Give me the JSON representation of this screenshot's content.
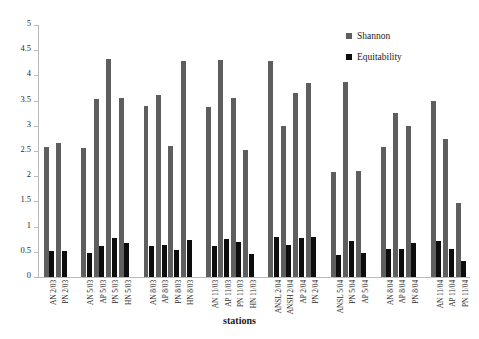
{
  "chart_data": {
    "type": "bar",
    "title": "",
    "xlabel": "stations",
    "ylabel": "",
    "ylim": [
      0,
      5
    ],
    "ytick_step": 0.5,
    "ytick_labels": [
      "0",
      "0.5",
      "1",
      "1.5",
      "2",
      "2.5",
      "3",
      "3.5",
      "4",
      "4.5",
      "5"
    ],
    "grid": false,
    "legend_position": "top-right",
    "categories": [
      "AN 2/03",
      "PN 2/03",
      "AN 5/03",
      "AP 5/03",
      "PN 5/03",
      "HN 5/03",
      "AN 8/03",
      "AP 8/03",
      "PN 8/03",
      "HN 8/03",
      "AN 11/03",
      "AP 11/03",
      "PN 11/03",
      "HN 11/03",
      "ANSL 2/04",
      "ANSH 2/04",
      "AP 2/04",
      "PN 2/04",
      "ANSL 5/04",
      "PN 5/04",
      "AP 5/04",
      "AN 8/04",
      "AP 8/04",
      "PN 8/04",
      "AN 11/04",
      "AP 11/04",
      "PN 11/04"
    ],
    "group_breaks_after": [
      1,
      5,
      9,
      13,
      17,
      20,
      23
    ],
    "series": [
      {
        "name": "Shannon",
        "color": "#5e5e5e",
        "values": [
          2.58,
          2.65,
          2.56,
          3.53,
          4.33,
          3.56,
          3.39,
          3.62,
          2.6,
          4.28,
          3.38,
          4.31,
          3.55,
          2.52,
          4.29,
          2.99,
          3.66,
          3.85,
          2.08,
          3.87,
          2.1,
          2.58,
          3.26,
          3.0,
          3.5,
          2.73,
          1.47
        ]
      },
      {
        "name": "Equitability",
        "color": "#0d0d0d",
        "values": [
          0.52,
          0.51,
          0.48,
          0.62,
          0.78,
          0.68,
          0.62,
          0.64,
          0.53,
          0.74,
          0.62,
          0.76,
          0.7,
          0.46,
          0.8,
          0.63,
          0.78,
          0.79,
          0.44,
          0.72,
          0.47,
          0.55,
          0.56,
          0.67,
          0.72,
          0.56,
          0.32
        ]
      }
    ]
  },
  "legend": {
    "items": [
      {
        "label": "Shannon",
        "color": "#5e5e5e"
      },
      {
        "label": "Equitability",
        "color": "#0d0d0d"
      }
    ]
  },
  "axis": {
    "x_title": "stations"
  }
}
